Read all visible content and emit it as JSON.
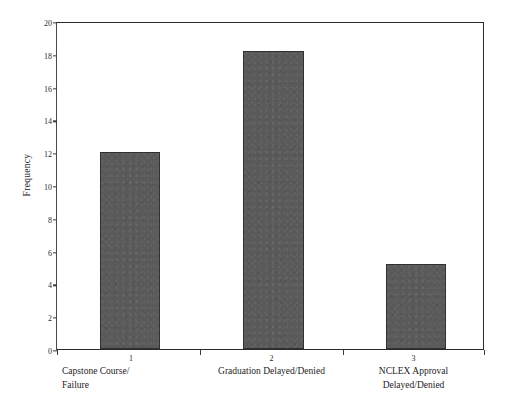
{
  "figure": {
    "background_color": "#ffffff",
    "frame_color": "#2b2b2b"
  },
  "chart_data": {
    "type": "bar",
    "title": "",
    "subtitle": "",
    "xlabel": "",
    "ylabel": "Frequency",
    "categories": [
      "Capstone Course/\nFailure",
      "Graduation Delayed/Denied",
      "NCLEX Approval\nDelayed/Denied"
    ],
    "category_numbers": [
      "1",
      "2",
      "3"
    ],
    "values": [
      12,
      18.2,
      5.2
    ],
    "ylim": [
      0,
      20
    ],
    "ytick_labels": [
      "0",
      "2",
      "4",
      "6",
      "8",
      "10",
      "12",
      "14",
      "16",
      "18",
      "20"
    ],
    "ytick_values": [
      0,
      2,
      4,
      6,
      8,
      10,
      12,
      14,
      16,
      18,
      20
    ],
    "grid": false,
    "legend": false,
    "bar_color": "#5a5a5a",
    "bar_edge_color": "#30302f",
    "annotations": []
  }
}
